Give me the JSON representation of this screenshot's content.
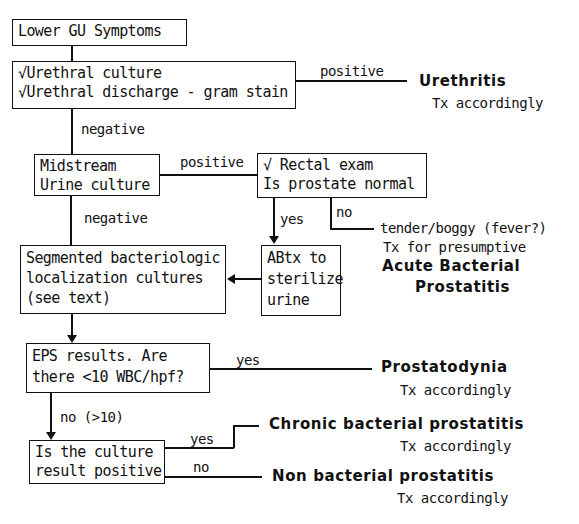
{
  "diagram": {
    "nodes": {
      "lower_gu": {
        "lines": [
          "Lower GU Symptoms"
        ]
      },
      "urethral": {
        "lines": [
          "√Urethral culture",
          "√Urethral discharge - gram stain"
        ]
      },
      "midstream": {
        "lines": [
          "Midstream",
          "Urine culture"
        ]
      },
      "rectal": {
        "lines": [
          "√ Rectal exam",
          "Is prostate normal"
        ]
      },
      "abtx": {
        "lines": [
          "ABtx to",
          "sterilize",
          "urine"
        ]
      },
      "segmented": {
        "lines": [
          "Segmented bacteriologic",
          "localization cultures",
          "(see text)"
        ]
      },
      "eps": {
        "lines": [
          "EPS results. Are",
          "there <10 WBC/hpf?"
        ]
      },
      "culture": {
        "lines": [
          "Is the culture",
          "result positive"
        ]
      }
    },
    "edge_labels": {
      "urethral_positive": "positive",
      "urethral_negative": "negative",
      "midstream_positive": "positive",
      "midstream_negative": "negative",
      "rectal_yes": "yes",
      "rectal_no": "no",
      "eps_yes": "yes",
      "eps_no": "no (>10)",
      "culture_yes": "yes",
      "culture_no": "no"
    },
    "outcomes": {
      "urethritis": {
        "title": "Urethritis",
        "sub": "Tx accordingly"
      },
      "acute": {
        "pre1": "tender/boggy (fever?)",
        "pre2": "Tx for presumptive",
        "title1": "Acute Bacterial",
        "title2": "Prostatitis"
      },
      "prostatodynia": {
        "title": "Prostatodynia",
        "sub": "Tx accordingly"
      },
      "chronic": {
        "title": "Chronic bacterial prostatitis",
        "sub": "Tx accordingly"
      },
      "nonbacterial": {
        "title": "Non bacterial prostatitis",
        "sub": "Tx accordingly"
      }
    }
  }
}
